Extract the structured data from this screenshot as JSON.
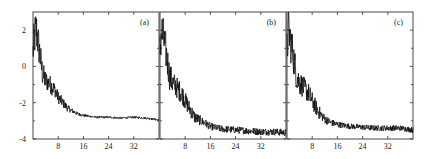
{
  "chart_data": {
    "type": "line",
    "title": "",
    "xlabel": "",
    "ylabel": "",
    "xlim": [
      0,
      40
    ],
    "ylim": [
      -4,
      3
    ],
    "x_ticks": [
      8,
      16,
      24,
      32
    ],
    "x_tick_labels": [
      "8",
      "16",
      "24",
      "32"
    ],
    "y_ticks": [
      2,
      0,
      -2,
      -4
    ],
    "y_tick_labels": [
      "2",
      "0",
      "-2",
      "-4"
    ],
    "grid": false,
    "legend": "none",
    "panels": [
      {
        "label": "(a)",
        "series": [
          {
            "name": "curve-a",
            "x": [
              0,
              0.5,
              1,
              2,
              3,
              4,
              5,
              6,
              7,
              8,
              9,
              10,
              11,
              12,
              14,
              16,
              18,
              20,
              24,
              28,
              32,
              36,
              40
            ],
            "y": [
              0.8,
              1.6,
              2.1,
              0.9,
              -0.4,
              -0.8,
              -0.9,
              -1.1,
              -1.3,
              -1.7,
              -1.9,
              -2.1,
              -2.3,
              -2.4,
              -2.6,
              -2.7,
              -2.75,
              -2.8,
              -2.8,
              -2.85,
              -2.8,
              -2.85,
              -2.95
            ],
            "noise": [
              1.0,
              1.2,
              1.2,
              1.0,
              0.7,
              0.6,
              0.5,
              0.5,
              0.4,
              0.35,
              0.3,
              0.25,
              0.2,
              0.15,
              0.1,
              0.08,
              0.06,
              0.06,
              0.06,
              0.06,
              0.06,
              0.06,
              0.06
            ]
          }
        ]
      },
      {
        "label": "(b)",
        "series": [
          {
            "name": "curve-b",
            "x": [
              0,
              0.5,
              1,
              2,
              3,
              4,
              5,
              6,
              7,
              8,
              9,
              10,
              11,
              12,
              14,
              16,
              18,
              20,
              24,
              28,
              32,
              36,
              40
            ],
            "y": [
              0.8,
              2.0,
              1.6,
              0.7,
              -0.5,
              -0.9,
              -1.1,
              -1.3,
              -1.5,
              -1.9,
              -2.2,
              -2.5,
              -2.8,
              -2.9,
              -3.1,
              -3.3,
              -3.4,
              -3.45,
              -3.5,
              -3.55,
              -3.6,
              -3.6,
              -3.65
            ],
            "noise": [
              1.2,
              1.2,
              1.2,
              1.0,
              0.8,
              0.7,
              0.6,
              0.6,
              0.55,
              0.5,
              0.45,
              0.4,
              0.35,
              0.3,
              0.25,
              0.2,
              0.2,
              0.2,
              0.2,
              0.2,
              0.2,
              0.2,
              0.2
            ]
          }
        ]
      },
      {
        "label": "(c)",
        "series": [
          {
            "name": "curve-c",
            "x": [
              0,
              0.5,
              1,
              2,
              3,
              4,
              5,
              6,
              7,
              8,
              9,
              10,
              11,
              12,
              14,
              16,
              18,
              20,
              24,
              28,
              32,
              36,
              40
            ],
            "y": [
              0.8,
              2.1,
              1.5,
              0.6,
              -0.5,
              -0.9,
              -1.1,
              -1.3,
              -1.5,
              -1.9,
              -2.2,
              -2.5,
              -2.7,
              -2.9,
              -3.1,
              -3.2,
              -3.25,
              -3.3,
              -3.35,
              -3.4,
              -3.4,
              -3.4,
              -3.5
            ],
            "noise": [
              1.2,
              1.2,
              1.2,
              1.0,
              0.8,
              0.7,
              0.6,
              0.6,
              0.55,
              0.5,
              0.45,
              0.4,
              0.3,
              0.25,
              0.2,
              0.18,
              0.16,
              0.16,
              0.16,
              0.16,
              0.16,
              0.16,
              0.16
            ]
          }
        ]
      }
    ]
  }
}
